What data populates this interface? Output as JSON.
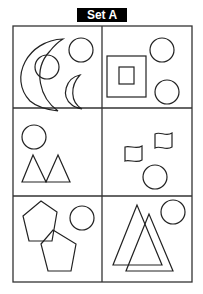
{
  "title": "Set A",
  "grid": {
    "rows": 3,
    "cols": 2
  },
  "cells": [
    {
      "id": "r1c1",
      "shapes": [
        "large crescent",
        "circle (overlapping crescent)",
        "circle",
        "small crescent"
      ]
    },
    {
      "id": "r1c2",
      "shapes": [
        "large square",
        "small square inside large square",
        "circle",
        "circle"
      ]
    },
    {
      "id": "r2c1",
      "shapes": [
        "circle",
        "triangle",
        "triangle"
      ]
    },
    {
      "id": "r2c2",
      "shapes": [
        "flag",
        "flag",
        "circle"
      ]
    },
    {
      "id": "r3c1",
      "shapes": [
        "pentagon",
        "pentagon (overlapping)",
        "circle"
      ]
    },
    {
      "id": "r3c2",
      "shapes": [
        "triangle",
        "triangle (overlapping)",
        "circle"
      ]
    }
  ],
  "colors": {
    "stroke": "#222222",
    "title_bg": "#000000",
    "title_text": "#ffffff"
  }
}
